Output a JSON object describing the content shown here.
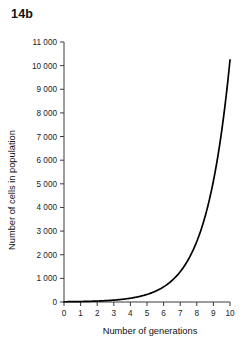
{
  "figure": {
    "label": "14b"
  },
  "chart_data": {
    "type": "line",
    "title": "14b",
    "xlabel": "Number of generations",
    "ylabel": "Number of cells in population",
    "xlim": [
      0,
      10
    ],
    "ylim": [
      0,
      11000
    ],
    "grid": false,
    "legend": false,
    "x_ticks": [
      0,
      1,
      2,
      3,
      4,
      5,
      6,
      7,
      8,
      9,
      10
    ],
    "x_tick_labels": [
      "0",
      "1",
      "2",
      "3",
      "4",
      "5",
      "6",
      "7",
      "8",
      "9",
      "10"
    ],
    "y_ticks": [
      0,
      1000,
      2000,
      3000,
      4000,
      5000,
      6000,
      7000,
      8000,
      9000,
      10000,
      11000
    ],
    "y_tick_labels": [
      "0",
      "1 000",
      "2 000",
      "3 000",
      "4 000",
      "5 000",
      "6 000",
      "7 000",
      "8 000",
      "9 000",
      "10 000",
      "11 000"
    ],
    "series": [
      {
        "name": "Cell population growth",
        "color": "#000000",
        "x": [
          0,
          1,
          2,
          3,
          4,
          5,
          6,
          7,
          8,
          9,
          10
        ],
        "values": [
          10,
          20,
          40,
          80,
          160,
          320,
          640,
          1280,
          2560,
          5120,
          10240
        ]
      }
    ]
  },
  "colors": {
    "curve": "#000000",
    "axis": "#3a3a3a",
    "text": "#111111",
    "background": "#ffffff"
  }
}
